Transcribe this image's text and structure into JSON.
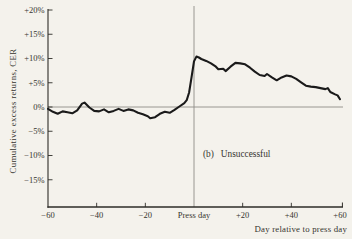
{
  "colors": {
    "background": "#f4f2ec",
    "curve": "#1a1a1a",
    "axis": "#2e2c28",
    "reference_line": "#8f8d88",
    "text": "#36342f"
  },
  "chart_data": {
    "type": "line",
    "title": "",
    "xlabel": "Day relative to press day",
    "ylabel": "Cumulative excess returns, CER",
    "panel_label": "(b)",
    "panel_title": "Unsuccessful",
    "xlim": [
      -60,
      62
    ],
    "ylim": [
      -21,
      20
    ],
    "grid": false,
    "legend_position": "none",
    "zero_line_y": 0,
    "press_day_x": 0,
    "y_ticks": [
      {
        "value": 20,
        "label": "+20%"
      },
      {
        "value": 15,
        "label": "+15%"
      },
      {
        "value": 10,
        "label": "+10%"
      },
      {
        "value": 5,
        "label": "+5%"
      },
      {
        "value": 0,
        "label": "0%"
      },
      {
        "value": -5,
        "label": "−5%"
      },
      {
        "value": -10,
        "label": "−10%"
      },
      {
        "value": -15,
        "label": "−15%"
      }
    ],
    "x_ticks": [
      {
        "value": -60,
        "label": "−60"
      },
      {
        "value": -40,
        "label": "−40"
      },
      {
        "value": -20,
        "label": "−20"
      },
      {
        "value": 0,
        "label": "Press day"
      },
      {
        "value": 20,
        "label": "+20"
      },
      {
        "value": 40,
        "label": "+40"
      },
      {
        "value": 60,
        "label": "+60"
      }
    ],
    "series": [
      {
        "name": "Cumulative excess returns (unsuccessful bids)",
        "points": [
          [
            -60,
            -0.4
          ],
          [
            -58,
            -1.0
          ],
          [
            -56,
            -1.4
          ],
          [
            -54,
            -0.9
          ],
          [
            -52,
            -1.1
          ],
          [
            -50,
            -1.3
          ],
          [
            -48,
            -0.7
          ],
          [
            -46,
            0.7
          ],
          [
            -45,
            0.9
          ],
          [
            -43,
            -0.1
          ],
          [
            -41,
            -0.8
          ],
          [
            -39,
            -0.9
          ],
          [
            -37,
            -0.5
          ],
          [
            -35,
            -1.1
          ],
          [
            -33,
            -0.8
          ],
          [
            -31,
            -0.4
          ],
          [
            -29,
            -0.8
          ],
          [
            -27,
            -0.5
          ],
          [
            -25,
            -0.7
          ],
          [
            -23,
            -1.2
          ],
          [
            -21,
            -1.5
          ],
          [
            -19,
            -1.9
          ],
          [
            -18,
            -2.3
          ],
          [
            -16,
            -2.1
          ],
          [
            -14,
            -1.4
          ],
          [
            -12,
            -1.0
          ],
          [
            -10,
            -1.2
          ],
          [
            -8,
            -0.6
          ],
          [
            -6,
            0.1
          ],
          [
            -4,
            0.8
          ],
          [
            -3,
            1.4
          ],
          [
            -2,
            3.0
          ],
          [
            -1,
            6.2
          ],
          [
            0,
            9.4
          ],
          [
            1,
            10.4
          ],
          [
            2,
            10.2
          ],
          [
            3,
            9.9
          ],
          [
            5,
            9.5
          ],
          [
            7,
            9.0
          ],
          [
            9,
            8.3
          ],
          [
            10,
            7.8
          ],
          [
            12,
            7.9
          ],
          [
            13,
            7.4
          ],
          [
            15,
            8.3
          ],
          [
            17,
            9.1
          ],
          [
            19,
            9.0
          ],
          [
            21,
            8.8
          ],
          [
            23,
            8.1
          ],
          [
            25,
            7.3
          ],
          [
            27,
            6.6
          ],
          [
            29,
            6.4
          ],
          [
            30,
            6.8
          ],
          [
            32,
            6.1
          ],
          [
            34,
            5.5
          ],
          [
            36,
            6.1
          ],
          [
            38,
            6.5
          ],
          [
            40,
            6.3
          ],
          [
            42,
            5.8
          ],
          [
            44,
            5.1
          ],
          [
            46,
            4.4
          ],
          [
            48,
            4.2
          ],
          [
            50,
            4.1
          ],
          [
            52,
            3.9
          ],
          [
            54,
            3.7
          ],
          [
            55,
            3.9
          ],
          [
            56,
            3.1
          ],
          [
            58,
            2.6
          ],
          [
            59,
            2.4
          ],
          [
            60,
            1.6
          ]
        ]
      }
    ]
  }
}
